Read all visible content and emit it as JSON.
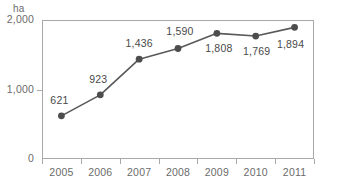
{
  "chart_data": {
    "type": "line",
    "title": "",
    "xlabel": "",
    "ylabel": "ha",
    "unit_label": "ha",
    "categories": [
      "2005",
      "2006",
      "2007",
      "2008",
      "2009",
      "2010",
      "2011"
    ],
    "values": [
      621,
      923,
      1436,
      1590,
      1808,
      1769,
      1894
    ],
    "value_labels": [
      "621",
      "923",
      "1,436",
      "1,590",
      "1,808",
      "1,769",
      "1,894"
    ],
    "ylim": [
      0,
      2000
    ],
    "ytick_values": [
      0,
      1000,
      2000
    ],
    "ytick_labels": [
      "0",
      "1,000",
      "2,000"
    ],
    "grid": false,
    "legend": "none",
    "series": [
      {
        "name": "ha",
        "values": [
          621,
          923,
          1436,
          1590,
          1808,
          1769,
          1894
        ]
      }
    ],
    "colors": {
      "line": "#595959",
      "marker": "#4d4d4d",
      "frame": "#a8a8a8",
      "tick_text": "#6b6b6b",
      "label_text": "#4a4a4a",
      "background": "#ffffff"
    },
    "label_offsets": [
      {
        "dx": -2,
        "dy": -16
      },
      {
        "dx": -2,
        "dy": -16
      },
      {
        "dx": 0,
        "dy": -16
      },
      {
        "dx": 2,
        "dy": -17
      },
      {
        "dx": 2,
        "dy": 15
      },
      {
        "dx": 1,
        "dy": 15
      },
      {
        "dx": -4,
        "dy": 17
      }
    ]
  }
}
